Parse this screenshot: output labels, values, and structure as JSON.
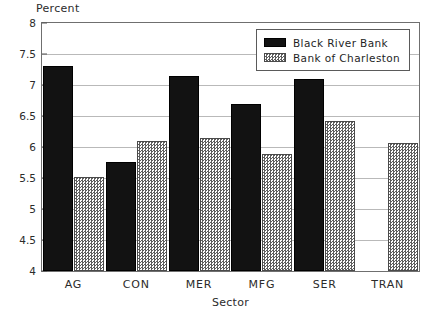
{
  "chart_data": {
    "type": "bar",
    "title": "",
    "xlabel": "Sector",
    "ylabel": "Percent",
    "categories": [
      "AG",
      "CON",
      "MER",
      "MFG",
      "SER",
      "TRAN"
    ],
    "series": [
      {
        "name": "Black River Bank",
        "swatch": "solid-black",
        "color": "#121212",
        "values": [
          7.3,
          5.76,
          7.15,
          6.7,
          7.1,
          null
        ]
      },
      {
        "name": "Bank of Charleston",
        "swatch": "checker-hatch",
        "color": "#5e5e5e",
        "values": [
          5.52,
          6.09,
          6.15,
          5.88,
          6.42,
          6.07
        ]
      }
    ],
    "ylim": [
      4,
      8
    ],
    "ytick_values": [
      4,
      4.5,
      5,
      5.5,
      6,
      6.5,
      7,
      7.5,
      8
    ],
    "ytick_labels": [
      "4",
      "4.5",
      "5",
      "5.5",
      "6",
      "6.5",
      "7",
      "7.5",
      "8"
    ],
    "grid": true,
    "legend_position": "top-right-inside"
  }
}
